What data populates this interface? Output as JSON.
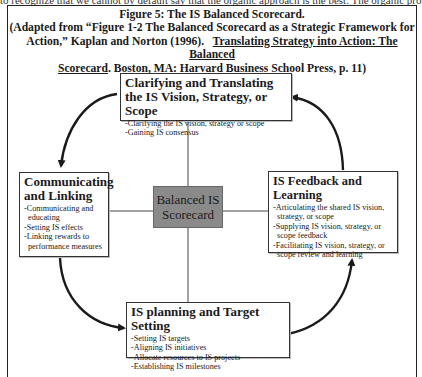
{
  "cutoff_text": "to recognize that we cannot by default say that the organic approach is the best. The organic pro",
  "figure": {
    "caption_line1": "Figure 5:  The IS Balanced Scorecard.",
    "caption_line2": "(Adapted from “Figure 1-2  The Balanced Scorecard as a Strategic Framework for",
    "caption_line3a": "Action,” Kaplan and Norton (1996).   ",
    "caption_line3b": "Translating Strategy into Action:  The Balanced",
    "caption_line4a": "Scorecard",
    "caption_line4b": ".  Boston, MA: Harvard Business School Press, p. 11)"
  },
  "center": {
    "line1": "Balanced IS",
    "line2": "Scorecard"
  },
  "boxes": {
    "top": {
      "title": "Clarifying and Translating the IS Vision, Strategy, or Scope",
      "items": [
        "-Clarifying the IS vision, strategy or scope",
        "-Gaining IS consensus"
      ]
    },
    "left": {
      "title": "Communicating and Linking",
      "items": [
        "-Communicating and educating",
        "-Setting IS effects",
        "-Linking rewards to performance measures"
      ]
    },
    "right": {
      "title": "IS Feedback and Learning",
      "items": [
        "-Articulating the shared IS vision, strategy, or scope",
        "-Supplying IS vision, strategy, or scope feedback",
        "-Facilitating IS vision, strategy, or scope review and learning"
      ]
    },
    "bottom": {
      "title": "IS planning and Target Setting",
      "items": [
        "-Setting IS targets",
        "-Aligning IS initiatives",
        "-Allocate resources to IS projects",
        "-Establishing IS milestones"
      ]
    }
  }
}
